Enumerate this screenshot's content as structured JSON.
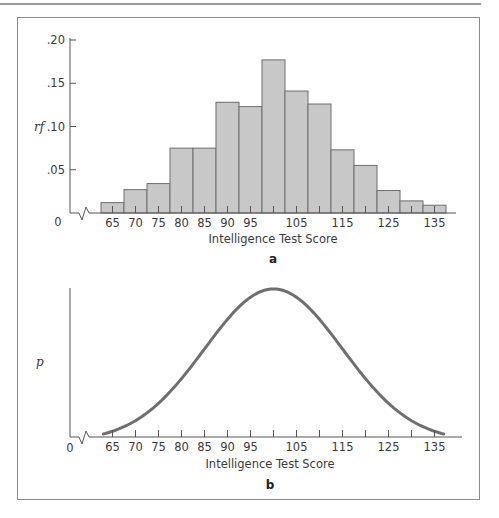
{
  "chart_data": [
    {
      "type": "bar",
      "panel_label": "a",
      "title": "",
      "xlabel": "Intelligence Test Score",
      "ylabel": "rf",
      "categories": [
        65,
        70,
        75,
        80,
        85,
        90,
        95,
        100,
        105,
        110,
        115,
        120,
        125,
        130,
        135
      ],
      "values": [
        0.012,
        0.027,
        0.034,
        0.075,
        0.075,
        0.128,
        0.123,
        0.177,
        0.141,
        0.126,
        0.073,
        0.055,
        0.026,
        0.014,
        0.009
      ],
      "bin_width": 5,
      "x_tick_labels": [
        "65",
        "70",
        "75",
        "80",
        "85",
        "90",
        "95",
        "105",
        "115",
        "125",
        "135"
      ],
      "x_tick_values": [
        65,
        70,
        75,
        80,
        85,
        90,
        95,
        105,
        115,
        125,
        135
      ],
      "x_minor_ticks": [
        65,
        70,
        75,
        80,
        85,
        90,
        95,
        100,
        105,
        110,
        115,
        120,
        125,
        130,
        135
      ],
      "y_tick_labels": [
        ".05",
        ".10",
        ".15",
        ".20"
      ],
      "y_tick_values": [
        0.05,
        0.1,
        0.15,
        0.2
      ],
      "origin_label": "0",
      "axis_break": true,
      "ylim": [
        0,
        0.2
      ],
      "xlim": [
        60,
        140
      ],
      "grid": false,
      "bar_color": "#c8c8c8",
      "bar_edge_color": "#6e6e6e"
    },
    {
      "type": "line",
      "panel_label": "b",
      "title": "",
      "xlabel": "Intelligence Test Score",
      "ylabel": "p",
      "distribution": "normal",
      "mean": 100,
      "sd": 15,
      "x_range": [
        63,
        137
      ],
      "x_tick_labels": [
        "65",
        "70",
        "75",
        "80",
        "85",
        "90",
        "95",
        "105",
        "115",
        "125",
        "135"
      ],
      "x_tick_values": [
        65,
        70,
        75,
        80,
        85,
        90,
        95,
        105,
        115,
        125,
        135
      ],
      "x_minor_ticks": [
        65,
        70,
        75,
        80,
        85,
        90,
        95,
        100,
        105,
        110,
        115,
        120,
        125,
        130,
        135
      ],
      "origin_label": "0",
      "axis_break": true,
      "xlim": [
        60,
        140
      ],
      "grid": false,
      "line_color": "#707070"
    }
  ]
}
